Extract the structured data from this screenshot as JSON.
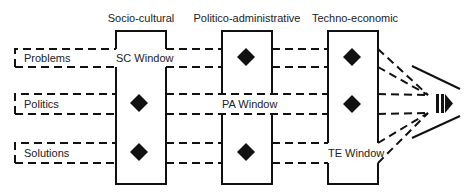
{
  "columns": [
    {
      "title": "Socio-cultural",
      "window_label": "SC Window"
    },
    {
      "title": "Politico-administrative",
      "window_label": "PA Window"
    },
    {
      "title": "Techno-economic",
      "window_label": "TE Window"
    }
  ],
  "streams": [
    {
      "label": "Problems"
    },
    {
      "label": "Politics"
    },
    {
      "label": "Solutions"
    }
  ],
  "colors": {
    "line": "#111111",
    "text": "#222222",
    "background": "#ffffff"
  }
}
